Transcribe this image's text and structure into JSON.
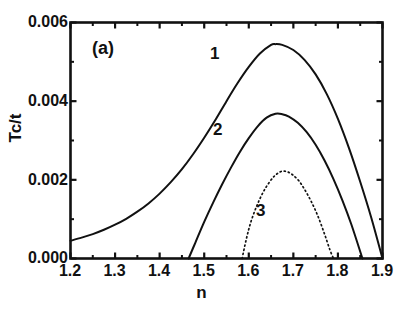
{
  "figure": {
    "panel_label": "(a)",
    "background_color": "#ffffff",
    "ink_color": "#111111"
  },
  "chart_data": {
    "type": "line",
    "title": "",
    "subtitle": "",
    "panel": "(a)",
    "xlabel": "n",
    "ylabel": "Tc/t",
    "xlim": [
      1.2,
      1.9
    ],
    "ylim": [
      0.0,
      0.006
    ],
    "xticks": [
      1.2,
      1.3,
      1.4,
      1.5,
      1.6,
      1.7,
      1.8,
      1.9
    ],
    "xtick_labels": [
      "1.2",
      "1.3",
      "1.4",
      "1.5",
      "1.6",
      "1.7",
      "1.8",
      "1.9"
    ],
    "yticks": [
      0.0,
      0.002,
      0.004,
      0.006
    ],
    "ytick_labels": [
      "0.000",
      "0.002",
      "0.004",
      "0.006"
    ],
    "minor_yticks": [
      0.001,
      0.003,
      0.005
    ],
    "grid": false,
    "legend": "inline-curve-numbers",
    "tick_direction": "in",
    "frame": "box",
    "annotations": [
      {
        "text": "(a)",
        "x": 1.255,
        "y": 0.00545,
        "name": "panel-label"
      },
      {
        "text": "1",
        "x": 1.535,
        "y": 0.00513,
        "name": "curve-1-label"
      },
      {
        "text": "2",
        "x": 1.542,
        "y": 0.00325,
        "name": "curve-2-label"
      },
      {
        "text": "3",
        "x": 1.638,
        "y": 0.00118,
        "name": "curve-3-label"
      }
    ],
    "series": [
      {
        "name": "1",
        "label": "1",
        "style": "solid",
        "color": "#111111",
        "linewidth": 2.0,
        "x": [
          1.2,
          1.225,
          1.25,
          1.275,
          1.3,
          1.325,
          1.35,
          1.375,
          1.4,
          1.425,
          1.45,
          1.475,
          1.5,
          1.525,
          1.55,
          1.575,
          1.6,
          1.625,
          1.65,
          1.66,
          1.675,
          1.7,
          1.725,
          1.75,
          1.775,
          1.8,
          1.825,
          1.85,
          1.875,
          1.9
        ],
        "y": [
          0.00045,
          0.00053,
          0.00062,
          0.00073,
          0.00086,
          0.00101,
          0.00119,
          0.0014,
          0.00165,
          0.00194,
          0.00227,
          0.00265,
          0.00307,
          0.00352,
          0.004,
          0.00446,
          0.00487,
          0.00521,
          0.00543,
          0.00545,
          0.00543,
          0.0053,
          0.00505,
          0.00468,
          0.00418,
          0.00355,
          0.0028,
          0.00195,
          0.00103,
          0.0
        ]
      },
      {
        "name": "2",
        "label": "2",
        "style": "solid",
        "color": "#111111",
        "linewidth": 2.0,
        "x": [
          1.465,
          1.48,
          1.5,
          1.52,
          1.54,
          1.56,
          1.58,
          1.6,
          1.62,
          1.64,
          1.66,
          1.675,
          1.69,
          1.71,
          1.73,
          1.75,
          1.77,
          1.79,
          1.81,
          1.83,
          1.855
        ],
        "y": [
          0.0,
          0.0004,
          0.00093,
          0.00142,
          0.00188,
          0.00231,
          0.00271,
          0.00306,
          0.00336,
          0.00358,
          0.00368,
          0.00367,
          0.00361,
          0.00345,
          0.00321,
          0.00289,
          0.00249,
          0.00202,
          0.00148,
          0.00087,
          0.0
        ]
      },
      {
        "name": "3",
        "label": "3",
        "style": "dotted",
        "color": "#111111",
        "linewidth": 1.7,
        "x": [
          1.585,
          1.595,
          1.605,
          1.618,
          1.632,
          1.645,
          1.658,
          1.672,
          1.685,
          1.698,
          1.712,
          1.725,
          1.74,
          1.755,
          1.77,
          1.782,
          1.79
        ],
        "y": [
          0.0,
          0.00052,
          0.00094,
          0.00134,
          0.00168,
          0.00192,
          0.0021,
          0.00221,
          0.00221,
          0.00213,
          0.00198,
          0.00176,
          0.00145,
          0.00108,
          0.00062,
          0.00022,
          0.0
        ]
      }
    ]
  },
  "axes": {
    "y_title": "Tc/t",
    "x_title": "n"
  }
}
